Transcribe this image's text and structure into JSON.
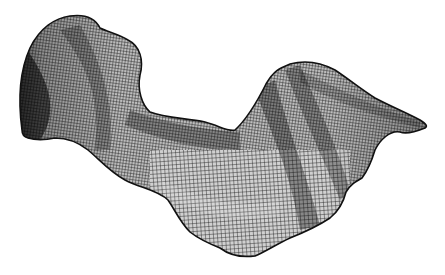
{
  "image": {
    "subject": "wireframe mesh rendering of a curved 3D surface",
    "background_color": "#ffffff",
    "mesh_color": "#1a1a1a",
    "shadow_color": "#0a0a0a",
    "highlight_color": "#9a9a9a"
  }
}
